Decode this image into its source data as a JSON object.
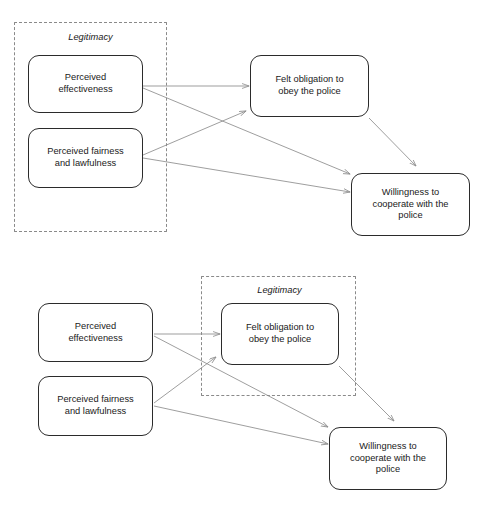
{
  "figure": {
    "type": "path-diagram",
    "panels": [
      {
        "id": "panel-top",
        "group": {
          "label": "Legitimacy",
          "members": [
            "Perceived effectiveness",
            "Perceived fairness and lawfulness"
          ]
        },
        "nodes": [
          {
            "id": "pe",
            "label": "Perceived\neffectiveness"
          },
          {
            "id": "pfl",
            "label": "Perceived fairness\nand lawfulness"
          },
          {
            "id": "fo",
            "label": "Felt obligation to\nobey the police"
          },
          {
            "id": "wc",
            "label": "Willingness to\ncooperate with the\npolice"
          }
        ],
        "edges": [
          {
            "from": "pe",
            "to": "fo"
          },
          {
            "from": "pe",
            "to": "wc"
          },
          {
            "from": "pfl",
            "to": "fo"
          },
          {
            "from": "pfl",
            "to": "wc"
          },
          {
            "from": "fo",
            "to": "wc"
          }
        ]
      },
      {
        "id": "panel-bottom",
        "group": {
          "label": "Legitimacy",
          "members": [
            "Felt obligation to obey the police"
          ]
        },
        "nodes": [
          {
            "id": "pe",
            "label": "Perceived\neffectiveness"
          },
          {
            "id": "pfl",
            "label": "Perceived fairness\nand lawfulness"
          },
          {
            "id": "fo",
            "label": "Felt obligation to\nobey the police"
          },
          {
            "id": "wc",
            "label": "Willingness to\ncooperate with the\npolice"
          }
        ],
        "edges": [
          {
            "from": "pe",
            "to": "fo"
          },
          {
            "from": "pe",
            "to": "wc"
          },
          {
            "from": "pfl",
            "to": "fo"
          },
          {
            "from": "pfl",
            "to": "wc"
          },
          {
            "from": "fo",
            "to": "wc"
          }
        ]
      }
    ]
  },
  "colors": {
    "node_border": "#2b2b2b",
    "group_border": "#8a8a8a",
    "arrow": "#8d8d8d",
    "text": "#1a1a1a",
    "background": "#ffffff"
  }
}
